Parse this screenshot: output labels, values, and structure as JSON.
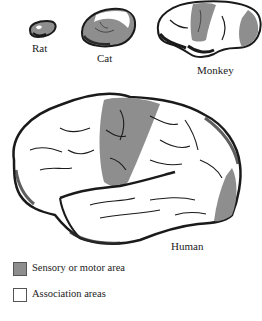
{
  "figure": {
    "species": [
      {
        "name": "Rat",
        "label": "Rat"
      },
      {
        "name": "Cat",
        "label": "Cat"
      },
      {
        "name": "Monkey",
        "label": "Monkey"
      },
      {
        "name": "Human",
        "label": "Human"
      }
    ],
    "legend": [
      {
        "label": "Sensory or motor area",
        "color": "#8e8e8e"
      },
      {
        "label": "Association areas",
        "color": "#ffffff"
      }
    ]
  },
  "colors": {
    "sensory_motor": "#8e8e8e",
    "association": "#ffffff",
    "outline": "#1a1a1a",
    "shadow": "#3a3a3a"
  }
}
